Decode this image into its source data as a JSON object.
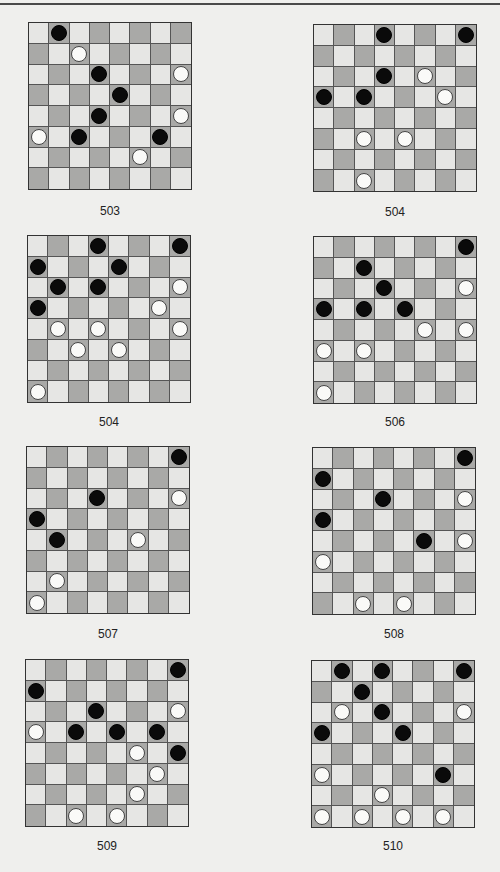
{
  "page": {
    "top_rule": true
  },
  "colors": {
    "background": "#efefed",
    "light_square": "#e6e6e4",
    "dark_square": "#a9a9a7",
    "black_piece": "#0a0a0a",
    "white_piece": "#fafaf8"
  },
  "puzzles": [
    {
      "label": "503",
      "pos": {
        "left": 28,
        "top": 22
      },
      "caption_top": 204,
      "pieces": [
        {
          "row": 0,
          "col": 1,
          "color": "black"
        },
        {
          "row": 1,
          "col": 2,
          "color": "white"
        },
        {
          "row": 2,
          "col": 3,
          "color": "black"
        },
        {
          "row": 2,
          "col": 7,
          "color": "white"
        },
        {
          "row": 3,
          "col": 4,
          "color": "black"
        },
        {
          "row": 4,
          "col": 3,
          "color": "black"
        },
        {
          "row": 4,
          "col": 7,
          "color": "white"
        },
        {
          "row": 5,
          "col": 0,
          "color": "white"
        },
        {
          "row": 5,
          "col": 2,
          "color": "black"
        },
        {
          "row": 5,
          "col": 6,
          "color": "black"
        },
        {
          "row": 6,
          "col": 5,
          "color": "white"
        }
      ]
    },
    {
      "label": "504",
      "pos": {
        "left": 313,
        "top": 24
      },
      "caption_top": 205,
      "pieces": [
        {
          "row": 0,
          "col": 3,
          "color": "black"
        },
        {
          "row": 0,
          "col": 7,
          "color": "black"
        },
        {
          "row": 2,
          "col": 3,
          "color": "black"
        },
        {
          "row": 2,
          "col": 5,
          "color": "white"
        },
        {
          "row": 3,
          "col": 0,
          "color": "black"
        },
        {
          "row": 3,
          "col": 2,
          "color": "black"
        },
        {
          "row": 3,
          "col": 6,
          "color": "white"
        },
        {
          "row": 5,
          "col": 2,
          "color": "white"
        },
        {
          "row": 5,
          "col": 4,
          "color": "white"
        },
        {
          "row": 7,
          "col": 2,
          "color": "white"
        }
      ]
    },
    {
      "label": "504",
      "pos": {
        "left": 27,
        "top": 235
      },
      "caption_top": 415,
      "pieces": [
        {
          "row": 0,
          "col": 3,
          "color": "black"
        },
        {
          "row": 0,
          "col": 7,
          "color": "black"
        },
        {
          "row": 1,
          "col": 0,
          "color": "black"
        },
        {
          "row": 1,
          "col": 4,
          "color": "black"
        },
        {
          "row": 2,
          "col": 1,
          "color": "black"
        },
        {
          "row": 2,
          "col": 3,
          "color": "black"
        },
        {
          "row": 2,
          "col": 7,
          "color": "white"
        },
        {
          "row": 3,
          "col": 0,
          "color": "black"
        },
        {
          "row": 3,
          "col": 6,
          "color": "white"
        },
        {
          "row": 4,
          "col": 1,
          "color": "white"
        },
        {
          "row": 4,
          "col": 3,
          "color": "white"
        },
        {
          "row": 4,
          "col": 7,
          "color": "white"
        },
        {
          "row": 5,
          "col": 2,
          "color": "white"
        },
        {
          "row": 5,
          "col": 4,
          "color": "white"
        },
        {
          "row": 7,
          "col": 0,
          "color": "white"
        }
      ]
    },
    {
      "label": "506",
      "pos": {
        "left": 313,
        "top": 236
      },
      "caption_top": 415,
      "pieces": [
        {
          "row": 0,
          "col": 7,
          "color": "black"
        },
        {
          "row": 1,
          "col": 2,
          "color": "black"
        },
        {
          "row": 2,
          "col": 3,
          "color": "black"
        },
        {
          "row": 2,
          "col": 7,
          "color": "white"
        },
        {
          "row": 3,
          "col": 0,
          "color": "black"
        },
        {
          "row": 3,
          "col": 2,
          "color": "black"
        },
        {
          "row": 3,
          "col": 4,
          "color": "black"
        },
        {
          "row": 4,
          "col": 5,
          "color": "white"
        },
        {
          "row": 4,
          "col": 7,
          "color": "white"
        },
        {
          "row": 5,
          "col": 0,
          "color": "white"
        },
        {
          "row": 5,
          "col": 2,
          "color": "white"
        },
        {
          "row": 7,
          "col": 0,
          "color": "white"
        }
      ]
    },
    {
      "label": "507",
      "pos": {
        "left": 26,
        "top": 446
      },
      "caption_top": 627,
      "pieces": [
        {
          "row": 0,
          "col": 7,
          "color": "black"
        },
        {
          "row": 2,
          "col": 3,
          "color": "black"
        },
        {
          "row": 2,
          "col": 7,
          "color": "white"
        },
        {
          "row": 3,
          "col": 0,
          "color": "black"
        },
        {
          "row": 4,
          "col": 1,
          "color": "black"
        },
        {
          "row": 4,
          "col": 5,
          "color": "white"
        },
        {
          "row": 6,
          "col": 1,
          "color": "white"
        },
        {
          "row": 7,
          "col": 0,
          "color": "white"
        }
      ]
    },
    {
      "label": "508",
      "pos": {
        "left": 312,
        "top": 447
      },
      "caption_top": 627,
      "pieces": [
        {
          "row": 0,
          "col": 7,
          "color": "black"
        },
        {
          "row": 1,
          "col": 0,
          "color": "black"
        },
        {
          "row": 2,
          "col": 3,
          "color": "black"
        },
        {
          "row": 2,
          "col": 7,
          "color": "white"
        },
        {
          "row": 3,
          "col": 0,
          "color": "black"
        },
        {
          "row": 4,
          "col": 5,
          "color": "black"
        },
        {
          "row": 4,
          "col": 7,
          "color": "white"
        },
        {
          "row": 5,
          "col": 0,
          "color": "white"
        },
        {
          "row": 7,
          "col": 2,
          "color": "white"
        },
        {
          "row": 7,
          "col": 4,
          "color": "white"
        }
      ]
    },
    {
      "label": "509",
      "pos": {
        "left": 25,
        "top": 659
      },
      "caption_top": 839,
      "pieces": [
        {
          "row": 0,
          "col": 7,
          "color": "black"
        },
        {
          "row": 1,
          "col": 0,
          "color": "black"
        },
        {
          "row": 2,
          "col": 3,
          "color": "black"
        },
        {
          "row": 2,
          "col": 7,
          "color": "white"
        },
        {
          "row": 3,
          "col": 0,
          "color": "white"
        },
        {
          "row": 3,
          "col": 2,
          "color": "black"
        },
        {
          "row": 3,
          "col": 4,
          "color": "black"
        },
        {
          "row": 3,
          "col": 6,
          "color": "black"
        },
        {
          "row": 4,
          "col": 5,
          "color": "white"
        },
        {
          "row": 4,
          "col": 7,
          "color": "black"
        },
        {
          "row": 5,
          "col": 6,
          "color": "white"
        },
        {
          "row": 6,
          "col": 5,
          "color": "white"
        },
        {
          "row": 7,
          "col": 2,
          "color": "white"
        },
        {
          "row": 7,
          "col": 4,
          "color": "white"
        }
      ]
    },
    {
      "label": "510",
      "pos": {
        "left": 311,
        "top": 660
      },
      "caption_top": 839,
      "pieces": [
        {
          "row": 0,
          "col": 1,
          "color": "black"
        },
        {
          "row": 0,
          "col": 3,
          "color": "black"
        },
        {
          "row": 0,
          "col": 7,
          "color": "black"
        },
        {
          "row": 1,
          "col": 2,
          "color": "black"
        },
        {
          "row": 2,
          "col": 1,
          "color": "white"
        },
        {
          "row": 2,
          "col": 3,
          "color": "black"
        },
        {
          "row": 2,
          "col": 7,
          "color": "white"
        },
        {
          "row": 3,
          "col": 0,
          "color": "black"
        },
        {
          "row": 3,
          "col": 4,
          "color": "black"
        },
        {
          "row": 5,
          "col": 0,
          "color": "white"
        },
        {
          "row": 5,
          "col": 6,
          "color": "black"
        },
        {
          "row": 6,
          "col": 3,
          "color": "white"
        },
        {
          "row": 7,
          "col": 0,
          "color": "white"
        },
        {
          "row": 7,
          "col": 2,
          "color": "white"
        },
        {
          "row": 7,
          "col": 4,
          "color": "white"
        },
        {
          "row": 7,
          "col": 6,
          "color": "white"
        }
      ]
    }
  ]
}
